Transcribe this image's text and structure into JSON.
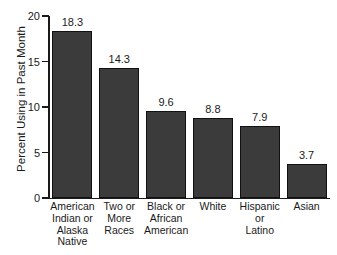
{
  "chart_data": {
    "type": "bar",
    "title": "",
    "xlabel": "",
    "ylabel": "Percent Using in Past Month",
    "ylim": [
      0,
      20
    ],
    "yticks": [
      0,
      5,
      10,
      15,
      20
    ],
    "ytick_labels": [
      "0",
      "5",
      "10",
      "15",
      "20"
    ],
    "grid": false,
    "legend": false,
    "categories": [
      "American\nIndian or\nAlaska\nNative",
      "Two or\nMore\nRaces",
      "Black or\nAfrican\nAmerican",
      "White",
      "Hispanic\nor\nLatino",
      "Asian"
    ],
    "values": [
      18.3,
      14.3,
      9.6,
      8.8,
      7.9,
      3.7
    ],
    "value_labels": [
      "18.3",
      "14.3",
      "9.6",
      "8.8",
      "7.9",
      "3.7"
    ],
    "bar_color": "#3b3b3b",
    "bar_edge_color": "#111111",
    "axis_color": "#1a1a1a",
    "background_color": "#ffffff"
  }
}
